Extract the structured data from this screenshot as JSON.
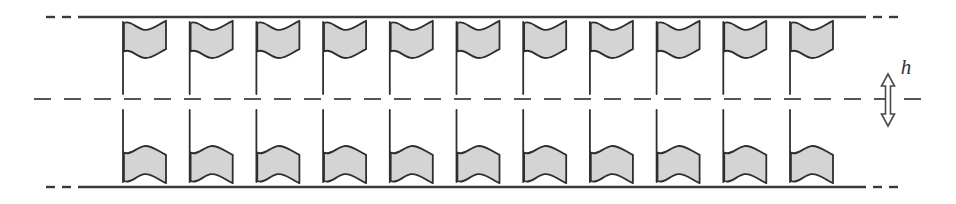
{
  "figure": {
    "domain_label": "fluid-structure-interaction-schematic",
    "background_color": "#ffffff"
  },
  "geometry": {
    "canvas_width": 956,
    "canvas_height": 204,
    "channel": {
      "top_wall_y": 17,
      "bottom_wall_y": 187,
      "centerline_y": 99,
      "wall_x_start": 78,
      "wall_x_end": 866,
      "wall_color": "#3a3a3a",
      "wall_thickness": 2.4
    },
    "centerline": {
      "x_start": 34,
      "x_end": 922,
      "color": "#555555",
      "thickness": 2,
      "dash_pattern": "17 13"
    },
    "wall_end_dashes": {
      "count_per_side": 2,
      "dash_length": 9,
      "gap_length": 7,
      "color": "#3a3a3a"
    }
  },
  "flags": {
    "count_per_row": 11,
    "rows": 2,
    "first_pole_x": 123,
    "pole_spacing": 66.7,
    "pole_color": "#3a3a3a",
    "pole_thickness": 1.8,
    "pole_length": 72,
    "fill_color": "#d4d4d4",
    "stroke_color": "#2e2e2e",
    "stroke_width": 1.8,
    "flag_width": 44,
    "flag_height": 38,
    "top_row": {
      "label": "upper row of flags",
      "orientation": "pole-down",
      "attached_wall": "top",
      "flag_top_y": 22
    },
    "bottom_row": {
      "label": "lower row of flags",
      "orientation": "pole-up",
      "attached_wall": "bottom",
      "flag_bottom_y": 182
    }
  },
  "annotation": {
    "gap_dimension": {
      "symbol": "h",
      "description": "gap height between the two rows of flags",
      "label_x": 906,
      "label_y": 74,
      "arrow_x": 888,
      "arrow_top_y": 74,
      "arrow_bottom_y": 126,
      "arrow_color": "#4a4a4a",
      "arrow_fill": "#ffffff",
      "arrow_head_width": 13,
      "arrow_head_height": 12,
      "arrow_shaft_width": 5
    }
  }
}
